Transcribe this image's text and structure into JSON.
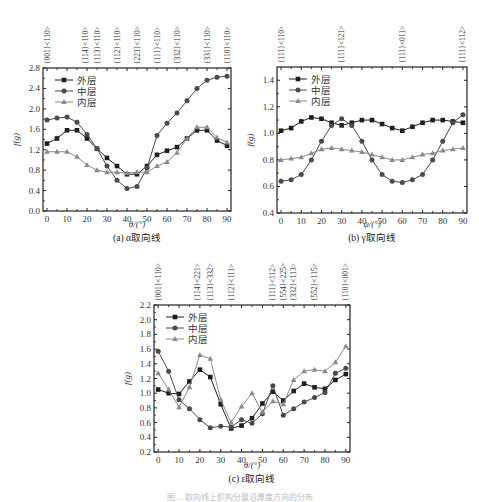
{
  "figure_caption_partial": "图 ... 取向线上织构分量沿厚度方向的分布",
  "legend": [
    "外层",
    "中层",
    "内层"
  ],
  "series_colors": {
    "外层": "#222222",
    "中层": "#555555",
    "内层": "#888888"
  },
  "charts": [
    {
      "id": "a",
      "caption": "(a) α取向线",
      "xlabel": "θ/(°)",
      "ylabel": "f(g)",
      "yticks": [
        "0.0",
        "0.4",
        "0.8",
        "1.2",
        "1.6",
        "2.0",
        "2.4",
        "2.8"
      ],
      "xticks": [
        "0",
        "10",
        "20",
        "30",
        "40",
        "50",
        "60",
        "70",
        "80",
        "90"
      ],
      "top_labels": [
        {
          "x": 0,
          "text": "{001}<110>"
        },
        {
          "x": 19,
          "text": "{114}<110>"
        },
        {
          "x": 25,
          "text": "{113}<110>"
        },
        {
          "x": 35,
          "text": "{112}<110>"
        },
        {
          "x": 45,
          "text": "{223}<110>"
        },
        {
          "x": 55,
          "text": "{111}<110>"
        },
        {
          "x": 65,
          "text": "{332}<110>"
        },
        {
          "x": 80,
          "text": "{331}<110>"
        },
        {
          "x": 90,
          "text": "{110}<110>"
        }
      ]
    },
    {
      "id": "b",
      "caption": "(b) γ取向线",
      "xlabel": "ψ/(°)",
      "ylabel": "f(g)",
      "yticks": [
        "0.4",
        "0.6",
        "0.8",
        "1.0",
        "1.2",
        "1.4"
      ],
      "xticks": [
        "0",
        "10",
        "20",
        "30",
        "40",
        "50",
        "60",
        "70",
        "80",
        "90"
      ],
      "top_labels": [
        {
          "x": 0,
          "text": "{111}<110>"
        },
        {
          "x": 30,
          "text": "{111}<121>"
        },
        {
          "x": 60,
          "text": "{111}<011>"
        },
        {
          "x": 90,
          "text": "{111}<112>"
        }
      ]
    },
    {
      "id": "c",
      "caption": "(c) ε取向线",
      "xlabel": "θ/(°)",
      "ylabel": "f(g)",
      "yticks": [
        "0.2",
        "0.4",
        "0.6",
        "0.8",
        "1.0",
        "1.2",
        "1.4",
        "1.6",
        "1.8",
        "2.0",
        "2.2"
      ],
      "xticks": [
        "0",
        "10",
        "20",
        "30",
        "40",
        "50",
        "60",
        "70",
        "80",
        "90"
      ],
      "top_labels": [
        {
          "x": 0,
          "text": "{001}<110>"
        },
        {
          "x": 19,
          "text": "{114}<221>"
        },
        {
          "x": 25,
          "text": "{113}<332>"
        },
        {
          "x": 35,
          "text": "{112}<111>"
        },
        {
          "x": 55,
          "text": "{111}<112>"
        },
        {
          "x": 60,
          "text": "{554}<225>"
        },
        {
          "x": 65,
          "text": "{332}<113>"
        },
        {
          "x": 75,
          "text": "{552}<115>"
        },
        {
          "x": 90,
          "text": "{110}<001>"
        }
      ]
    }
  ],
  "chart_data": [
    {
      "type": "line",
      "title": "(a) α取向线",
      "xlabel": "θ/(°)",
      "ylabel": "f(g)",
      "xlim": [
        -2,
        92
      ],
      "ylim": [
        0.0,
        2.8
      ],
      "grid": false,
      "legend_position": "upper-left",
      "x": [
        0,
        5,
        10,
        15,
        20,
        25,
        30,
        35,
        40,
        45,
        50,
        55,
        60,
        65,
        70,
        75,
        80,
        85,
        90
      ],
      "series": [
        {
          "name": "外层",
          "marker": "square",
          "values": [
            1.32,
            1.42,
            1.58,
            1.58,
            1.42,
            1.22,
            1.04,
            0.88,
            0.72,
            0.72,
            0.88,
            1.1,
            1.18,
            1.25,
            1.42,
            1.58,
            1.58,
            1.38,
            1.28
          ]
        },
        {
          "name": "中层",
          "marker": "circle",
          "values": [
            1.78,
            1.82,
            1.84,
            1.74,
            1.5,
            1.22,
            0.88,
            0.6,
            0.44,
            0.48,
            0.84,
            1.48,
            1.72,
            1.92,
            2.16,
            2.4,
            2.56,
            2.62,
            2.64
          ]
        },
        {
          "name": "内层",
          "marker": "triangle",
          "values": [
            1.16,
            1.16,
            1.16,
            1.06,
            0.9,
            0.8,
            0.76,
            0.76,
            0.74,
            0.76,
            0.76,
            0.88,
            0.96,
            1.14,
            1.42,
            1.64,
            1.64,
            1.44,
            1.34
          ]
        }
      ]
    },
    {
      "type": "line",
      "title": "(b) γ取向线",
      "xlabel": "ψ/(°)",
      "ylabel": "f(g)",
      "xlim": [
        -2,
        92
      ],
      "ylim": [
        0.4,
        1.5
      ],
      "grid": false,
      "legend_position": "upper-left",
      "x": [
        0,
        5,
        10,
        15,
        20,
        25,
        30,
        35,
        40,
        45,
        50,
        55,
        60,
        65,
        70,
        75,
        80,
        85,
        90
      ],
      "series": [
        {
          "name": "外层",
          "marker": "square",
          "values": [
            1.02,
            1.04,
            1.09,
            1.12,
            1.11,
            1.08,
            1.06,
            1.08,
            1.1,
            1.1,
            1.07,
            1.04,
            1.02,
            1.05,
            1.08,
            1.1,
            1.1,
            1.09,
            1.08
          ]
        },
        {
          "name": "中层",
          "marker": "circle",
          "values": [
            0.64,
            0.65,
            0.69,
            0.8,
            0.94,
            1.06,
            1.11,
            1.06,
            0.94,
            0.8,
            0.69,
            0.64,
            0.63,
            0.65,
            0.69,
            0.8,
            0.94,
            1.08,
            1.14
          ]
        },
        {
          "name": "内层",
          "marker": "triangle",
          "values": [
            0.8,
            0.81,
            0.82,
            0.85,
            0.88,
            0.89,
            0.88,
            0.87,
            0.86,
            0.84,
            0.82,
            0.8,
            0.8,
            0.82,
            0.84,
            0.85,
            0.87,
            0.88,
            0.89
          ]
        }
      ]
    },
    {
      "type": "line",
      "title": "(c) ε取向线",
      "xlabel": "θ/(°)",
      "ylabel": "f(g)",
      "xlim": [
        -2,
        92
      ],
      "ylim": [
        0.2,
        2.2
      ],
      "grid": false,
      "legend_position": "upper-left",
      "x": [
        0,
        5,
        10,
        15,
        20,
        25,
        30,
        35,
        40,
        45,
        50,
        55,
        60,
        65,
        70,
        75,
        80,
        85,
        90
      ],
      "series": [
        {
          "name": "外层",
          "marker": "square",
          "values": [
            1.05,
            1.0,
            0.99,
            1.16,
            1.32,
            1.22,
            0.85,
            0.52,
            0.56,
            0.66,
            0.86,
            1.02,
            0.9,
            1.03,
            1.13,
            1.08,
            1.06,
            1.18,
            1.26
          ]
        },
        {
          "name": "中层",
          "marker": "circle",
          "values": [
            1.57,
            1.3,
            0.91,
            0.79,
            0.64,
            0.53,
            0.55,
            0.54,
            0.64,
            0.59,
            0.72,
            1.1,
            0.7,
            0.79,
            0.88,
            0.94,
            1.01,
            1.27,
            1.34
          ]
        },
        {
          "name": "内层",
          "marker": "triangle",
          "values": [
            1.27,
            1.05,
            0.81,
            1.08,
            1.52,
            1.47,
            0.91,
            0.6,
            0.82,
            1.0,
            0.74,
            0.89,
            0.85,
            1.18,
            1.3,
            1.32,
            1.3,
            1.42,
            1.64
          ]
        }
      ]
    }
  ]
}
